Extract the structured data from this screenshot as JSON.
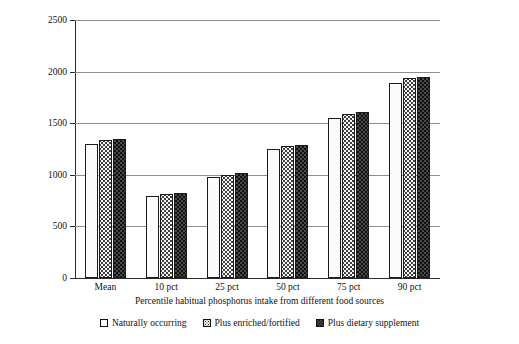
{
  "chart_data": {
    "type": "bar",
    "title": "",
    "xlabel": "Percentile habitual phosphorus intake from different food sources",
    "ylabel": "Phosphorus intake, mg/d",
    "categories": [
      "Mean",
      "10 pct",
      "25 pct",
      "50 pct",
      "75 pct",
      "90 pct"
    ],
    "series": [
      {
        "name": "Naturally occurring",
        "values": [
          1300,
          790,
          980,
          1250,
          1550,
          1890
        ]
      },
      {
        "name": "Plus enriched/fortified",
        "values": [
          1340,
          810,
          1000,
          1280,
          1590,
          1940
        ]
      },
      {
        "name": "Plus dietary supplement",
        "values": [
          1350,
          820,
          1020,
          1290,
          1610,
          1950
        ]
      }
    ],
    "ylim": [
      0,
      2500
    ],
    "yticks": [
      0,
      500,
      1000,
      1500,
      2000,
      2500
    ],
    "ytick_labels": [
      "0",
      "500",
      "1000",
      "1500",
      "2000",
      "2500"
    ],
    "grid": "horizontal",
    "legend_position": "bottom",
    "colors": {
      "axis": "#2a2a2a",
      "grid": "#8d8d8d",
      "bar_outline": "#1a1a1a",
      "background": "#ffffff"
    }
  },
  "legend": {
    "items": [
      {
        "label": "Naturally occurring",
        "swatch": "empty-square-icon"
      },
      {
        "label": "Plus enriched/fortified",
        "swatch": "dotted-square-icon"
      },
      {
        "label": "Plus dietary supplement",
        "swatch": "checkered-square-icon"
      }
    ]
  }
}
